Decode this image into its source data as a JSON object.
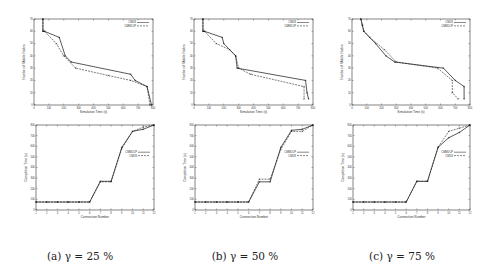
{
  "chart_data": [
    {
      "id": "a-top",
      "type": "line",
      "xlabel": "Simulation Time (s)",
      "ylabel": "Number of Mobile Nodes",
      "xlim": [
        0,
        800
      ],
      "ylim": [
        0,
        70
      ],
      "xticks": [
        0,
        100,
        200,
        300,
        400,
        500,
        600,
        700,
        800
      ],
      "yticks": [
        0,
        10,
        20,
        30,
        40,
        50,
        60,
        70
      ],
      "legend": [
        "CMDS",
        "CMMDCP"
      ],
      "legend_position": "upper right",
      "series": [
        {
          "name": "CMDS",
          "dash": "",
          "x": [
            60,
            60,
            70,
            170,
            210,
            250,
            650,
            680,
            760,
            790
          ],
          "y": [
            70,
            60,
            60,
            55,
            40,
            35,
            25,
            20,
            15,
            0
          ]
        },
        {
          "name": "CMMDCP",
          "dash": "2,1",
          "x": [
            60,
            60,
            70,
            150,
            200,
            280,
            500,
            650,
            760,
            780
          ],
          "y": [
            70,
            60,
            60,
            50,
            40,
            30,
            24,
            20,
            15,
            0
          ]
        }
      ]
    },
    {
      "id": "b-top",
      "type": "line",
      "xlabel": "Simulation Time (s)",
      "ylabel": "Number of Mobile Nodes",
      "xlim": [
        0,
        800
      ],
      "ylim": [
        0,
        70
      ],
      "xticks": [
        0,
        100,
        200,
        300,
        400,
        500,
        600,
        700,
        800
      ],
      "yticks": [
        0,
        10,
        20,
        30,
        40,
        50,
        60,
        70
      ],
      "legend": [
        "CMDS",
        "CMMDCP"
      ],
      "legend_position": "upper right",
      "series": [
        {
          "name": "CMDS",
          "dash": "",
          "x": [
            60,
            60,
            70,
            190,
            200,
            280,
            290,
            750,
            760,
            770
          ],
          "y": [
            70,
            60,
            60,
            55,
            50,
            40,
            30,
            20,
            10,
            5
          ]
        },
        {
          "name": "CMMDCP",
          "dash": "2,1",
          "x": [
            60,
            60,
            70,
            150,
            240,
            280,
            300,
            380,
            740,
            740
          ],
          "y": [
            70,
            60,
            60,
            50,
            45,
            40,
            30,
            25,
            15,
            5
          ]
        }
      ]
    },
    {
      "id": "c-top",
      "type": "line",
      "xlabel": "Simulation Time (s)",
      "ylabel": "Number of Mobile Nodes",
      "xlim": [
        0,
        800
      ],
      "ylim": [
        0,
        70
      ],
      "xticks": [
        0,
        100,
        200,
        300,
        400,
        500,
        600,
        700,
        800
      ],
      "yticks": [
        0,
        10,
        20,
        30,
        40,
        50,
        60,
        70
      ],
      "legend": [
        "CMDS",
        "CMMDCP"
      ],
      "legend_position": "upper right",
      "series": [
        {
          "name": "CMDS",
          "dash": "",
          "x": [
            60,
            70,
            80,
            160,
            230,
            290,
            620,
            700,
            760,
            760
          ],
          "y": [
            70,
            65,
            60,
            50,
            40,
            35,
            30,
            20,
            15,
            5
          ]
        },
        {
          "name": "CMMDCP",
          "dash": "2,1",
          "x": [
            60,
            70,
            80,
            120,
            220,
            300,
            580,
            680,
            680,
            720
          ],
          "y": [
            70,
            65,
            60,
            55,
            45,
            35,
            30,
            20,
            10,
            5
          ]
        }
      ]
    },
    {
      "id": "a-bottom",
      "type": "line",
      "xlabel": "Connection Number",
      "ylabel": "Completion Time (s)",
      "xlim": [
        1,
        12
      ],
      "ylim": [
        0,
        800
      ],
      "xticks": [
        1,
        2,
        3,
        4,
        5,
        6,
        7,
        8,
        9,
        10,
        11,
        12
      ],
      "yticks": [
        0,
        100,
        200,
        300,
        400,
        500,
        600,
        700,
        800
      ],
      "legend": [
        "CMMDCP",
        "CMDS"
      ],
      "legend_position": "center right",
      "series": [
        {
          "name": "CMMDCP",
          "dash": "",
          "x": [
            1,
            2,
            3,
            4,
            5,
            6,
            7,
            8,
            9,
            10,
            11,
            12
          ],
          "y": [
            75,
            75,
            75,
            75,
            75,
            75,
            270,
            270,
            590,
            740,
            760,
            800
          ]
        },
        {
          "name": "CMDS",
          "dash": "2,1",
          "x": [
            1,
            2,
            3,
            4,
            5,
            6,
            7,
            8,
            9,
            10,
            11,
            12
          ],
          "y": [
            75,
            75,
            75,
            75,
            75,
            75,
            265,
            265,
            580,
            740,
            780,
            800
          ]
        }
      ]
    },
    {
      "id": "b-bottom",
      "type": "line",
      "xlabel": "Connection Number",
      "ylabel": "Completion Time (s)",
      "xlim": [
        1,
        12
      ],
      "ylim": [
        0,
        800
      ],
      "xticks": [
        1,
        2,
        3,
        4,
        5,
        6,
        7,
        8,
        9,
        10,
        11,
        12
      ],
      "yticks": [
        0,
        100,
        200,
        300,
        400,
        500,
        600,
        700,
        800
      ],
      "legend": [
        "CMMDCP",
        "CMDS"
      ],
      "legend_position": "center right",
      "series": [
        {
          "name": "CMMDCP",
          "dash": "",
          "x": [
            1,
            2,
            3,
            4,
            5,
            6,
            7,
            8,
            9,
            10,
            11,
            12
          ],
          "y": [
            75,
            75,
            75,
            75,
            75,
            75,
            265,
            265,
            590,
            750,
            760,
            800
          ]
        },
        {
          "name": "CMDS",
          "dash": "2,1",
          "x": [
            1,
            2,
            3,
            4,
            5,
            6,
            7,
            8,
            9,
            10,
            11,
            12
          ],
          "y": [
            75,
            75,
            75,
            75,
            75,
            75,
            290,
            290,
            570,
            740,
            740,
            800
          ]
        }
      ]
    },
    {
      "id": "c-bottom",
      "type": "line",
      "xlabel": "Connection Number",
      "ylabel": "Completion Time (s)",
      "xlim": [
        1,
        12
      ],
      "ylim": [
        0,
        800
      ],
      "xticks": [
        1,
        2,
        3,
        4,
        5,
        6,
        7,
        8,
        9,
        10,
        11,
        12
      ],
      "yticks": [
        0,
        100,
        200,
        300,
        400,
        500,
        600,
        700,
        800
      ],
      "legend": [
        "CMMDCP",
        "CMDS"
      ],
      "legend_position": "center right",
      "series": [
        {
          "name": "CMMDCP",
          "dash": "",
          "x": [
            1,
            2,
            3,
            4,
            5,
            6,
            7,
            8,
            9,
            10,
            11,
            12
          ],
          "y": [
            75,
            75,
            75,
            75,
            75,
            75,
            270,
            270,
            590,
            680,
            730,
            800
          ]
        },
        {
          "name": "CMDS",
          "dash": "2,1",
          "x": [
            1,
            2,
            3,
            4,
            5,
            6,
            7,
            8,
            9,
            10,
            11,
            12
          ],
          "y": [
            75,
            75,
            75,
            75,
            75,
            75,
            270,
            270,
            590,
            740,
            770,
            800
          ]
        }
      ]
    }
  ],
  "captions": {
    "a": "(a) γ = 25 %",
    "b": "(b) γ = 50 %",
    "c": "(c) γ = 75 %"
  },
  "layout": {
    "plots": [
      {
        "chart": 0,
        "left": 34,
        "top": 19,
        "width": 119,
        "height": 86
      },
      {
        "chart": 1,
        "left": 194,
        "top": 19,
        "width": 119,
        "height": 86
      },
      {
        "chart": 2,
        "left": 352,
        "top": 19,
        "width": 118,
        "height": 86
      },
      {
        "chart": 3,
        "left": 36,
        "top": 125,
        "width": 118,
        "height": 85
      },
      {
        "chart": 4,
        "left": 195,
        "top": 125,
        "width": 118,
        "height": 85
      },
      {
        "chart": 5,
        "left": 353,
        "top": 125,
        "width": 117,
        "height": 85
      }
    ]
  }
}
